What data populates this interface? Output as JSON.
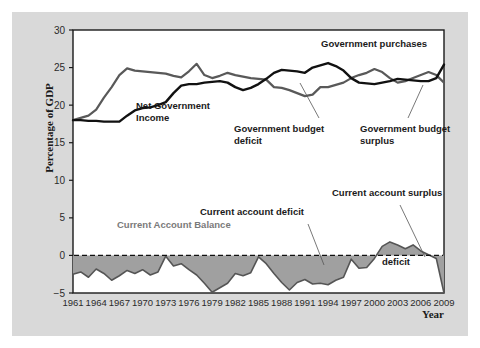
{
  "figure": {
    "background_color": "#d9d9d9",
    "plot_background_color": "#ffffff",
    "border_color": "#1a1a1a"
  },
  "axis": {
    "ylabel": "Percentage of GDP",
    "xlabel": "Year",
    "yticks": [
      "30",
      "25",
      "20",
      "15",
      "10",
      "5",
      "0",
      "−5"
    ],
    "xticks": [
      "1961",
      "1964",
      "1967",
      "1970",
      "1973",
      "1976",
      "1979",
      "1982",
      "1985",
      "1988",
      "1991",
      "1994",
      "1997",
      "2000",
      "2003",
      "2006",
      "2009"
    ]
  },
  "annotations": {
    "government_purchases": "Government purchases",
    "net_government_income_line1": "Net Government",
    "net_government_income_line2": "Income",
    "budget_deficit_line1": "Government budget",
    "budget_deficit_line2": "deficit",
    "budget_surplus_line1": "Government budget",
    "budget_surplus_line2": "surplus",
    "current_account_balance": "Current Account Balance",
    "current_account_deficit": "Current account deficit",
    "current_account_surplus": "Current account surplus",
    "deficit": "deficit"
  },
  "colors": {
    "purchases_line": "#111111",
    "income_line": "#595959",
    "area_fill": "#a0a0a0",
    "area_stroke": "#555555",
    "zero_line": "#111111",
    "gray_text": "#7a7a7a"
  },
  "chart_data": {
    "type": "line",
    "title": "",
    "xlabel": "Year",
    "ylabel": "Percentage of GDP",
    "xlim": [
      1961,
      2009
    ],
    "ylim": [
      -5,
      30
    ],
    "grid": false,
    "legend": "annotations",
    "x": [
      1961,
      1962,
      1963,
      1964,
      1965,
      1966,
      1967,
      1968,
      1969,
      1970,
      1971,
      1972,
      1973,
      1974,
      1975,
      1976,
      1977,
      1978,
      1979,
      1980,
      1981,
      1982,
      1983,
      1984,
      1985,
      1986,
      1987,
      1988,
      1989,
      1990,
      1991,
      1992,
      1993,
      1994,
      1995,
      1996,
      1997,
      1998,
      1999,
      2000,
      2001,
      2002,
      2003,
      2004,
      2005,
      2006,
      2007,
      2008,
      2009
    ],
    "series": [
      {
        "name": "Government purchases",
        "color": "#111111",
        "values": [
          18.0,
          18.0,
          17.9,
          17.9,
          17.8,
          17.8,
          17.8,
          18.6,
          19.3,
          19.6,
          19.7,
          20.0,
          20.4,
          21.6,
          22.6,
          22.8,
          22.8,
          23.0,
          23.1,
          23.2,
          23.0,
          22.4,
          22.0,
          22.3,
          22.8,
          23.5,
          24.3,
          24.7,
          24.6,
          24.5,
          24.3,
          25.0,
          25.3,
          25.6,
          25.2,
          24.6,
          23.6,
          23.0,
          22.9,
          22.8,
          23.0,
          23.2,
          23.5,
          23.4,
          23.3,
          23.2,
          23.2,
          23.6,
          25.4
        ]
      },
      {
        "name": "Net Government Income",
        "color": "#595959",
        "values": [
          18.0,
          18.3,
          18.6,
          19.4,
          21.0,
          22.4,
          24.0,
          24.9,
          24.6,
          24.5,
          24.4,
          24.3,
          24.2,
          23.9,
          23.7,
          24.5,
          25.5,
          24.0,
          23.6,
          23.9,
          24.3,
          24.0,
          23.8,
          23.6,
          23.5,
          23.4,
          22.4,
          22.3,
          22.0,
          21.6,
          21.2,
          21.4,
          22.4,
          22.4,
          22.7,
          23.0,
          23.6,
          24.0,
          24.3,
          24.8,
          24.4,
          23.6,
          23.0,
          23.2,
          23.6,
          24.0,
          24.4,
          24.0,
          23.0
        ]
      },
      {
        "name": "Current Account Balance",
        "color": "#a0a0a0",
        "type": "area",
        "values": [
          -2.5,
          -2.2,
          -2.9,
          -1.8,
          -2.4,
          -3.3,
          -2.7,
          -2.0,
          -2.4,
          -1.9,
          -2.6,
          -2.2,
          -0.1,
          -1.4,
          -1.1,
          -1.9,
          -2.6,
          -3.7,
          -4.9,
          -4.3,
          -3.7,
          -2.4,
          -2.7,
          -2.3,
          -0.2,
          -1.1,
          -2.4,
          -3.6,
          -4.6,
          -3.6,
          -3.2,
          -3.8,
          -3.7,
          -3.9,
          -3.3,
          -2.9,
          -0.5,
          -1.7,
          -1.6,
          -0.4,
          1.2,
          1.8,
          1.4,
          0.9,
          1.4,
          0.6,
          0.1,
          -0.4,
          -5.0
        ]
      }
    ]
  }
}
